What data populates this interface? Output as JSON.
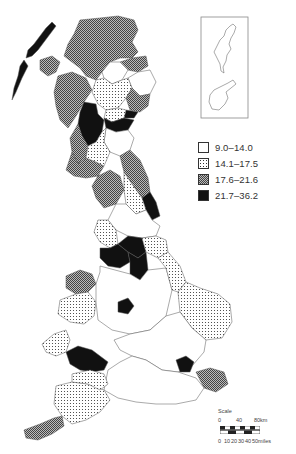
{
  "map": {
    "type": "choropleth",
    "subject": "Great Britain local authority districts",
    "classes": [
      {
        "id": "c1",
        "label": "9.0–14.0",
        "fill": "#ffffff",
        "pattern": "none"
      },
      {
        "id": "c2",
        "label": "14.1–17.5",
        "fill": "#ffffff",
        "pattern": "dots"
      },
      {
        "id": "c3",
        "label": "17.6–21.6",
        "fill": "#8a8a8a",
        "pattern": "crosshatch"
      },
      {
        "id": "c4",
        "label": "21.7–36.2",
        "fill": "#111111",
        "pattern": "solid"
      }
    ],
    "inset": {
      "label": "Shetland Islands",
      "class": "c1"
    }
  },
  "legend": {
    "items": [
      {
        "label": "9.0–14.0"
      },
      {
        "label": "14.1–17.5"
      },
      {
        "label": "17.6–21.6"
      },
      {
        "label": "21.7–36.2"
      }
    ]
  },
  "scale": {
    "title": "Scale",
    "km_ticks": [
      "0",
      "40",
      "80km"
    ],
    "mile_ticks": [
      "0",
      "10",
      "20",
      "30",
      "40",
      "50miles"
    ]
  },
  "regions": [
    {
      "name": "western-isles",
      "class": "c4"
    },
    {
      "name": "highland",
      "class": "c3"
    },
    {
      "name": "skye-lochalsh",
      "class": "c3"
    },
    {
      "name": "argyll",
      "class": "c3"
    },
    {
      "name": "grampian-north",
      "class": "c3"
    },
    {
      "name": "moray",
      "class": "c1"
    },
    {
      "name": "aberdeen",
      "class": "c1"
    },
    {
      "name": "perth-kinross",
      "class": "c2"
    },
    {
      "name": "angus",
      "class": "c3"
    },
    {
      "name": "dundee",
      "class": "c4"
    },
    {
      "name": "fife",
      "class": "c2"
    },
    {
      "name": "clydeside",
      "class": "c4"
    },
    {
      "name": "edinburgh-lothian",
      "class": "c4"
    },
    {
      "name": "borders",
      "class": "c1"
    },
    {
      "name": "ayrshire",
      "class": "c3"
    },
    {
      "name": "dumfries-galloway",
      "class": "c3"
    },
    {
      "name": "lanark",
      "class": "c2"
    },
    {
      "name": "northumberland",
      "class": "c3"
    },
    {
      "name": "tyne-wear",
      "class": "c4"
    },
    {
      "name": "cumbria",
      "class": "c3"
    },
    {
      "name": "durham",
      "class": "c2"
    },
    {
      "name": "north-yorkshire",
      "class": "c1"
    },
    {
      "name": "lancashire",
      "class": "c2"
    },
    {
      "name": "merseyside-manchester",
      "class": "c4"
    },
    {
      "name": "west-yorkshire",
      "class": "c4"
    },
    {
      "name": "south-yorkshire",
      "class": "c4"
    },
    {
      "name": "humberside",
      "class": "c2"
    },
    {
      "name": "north-wales",
      "class": "c3"
    },
    {
      "name": "mid-wales",
      "class": "c2"
    },
    {
      "name": "south-wales-valleys",
      "class": "c4"
    },
    {
      "name": "dyfed",
      "class": "c2"
    },
    {
      "name": "midlands",
      "class": "c1"
    },
    {
      "name": "birmingham",
      "class": "c4"
    },
    {
      "name": "lincolnshire",
      "class": "c2"
    },
    {
      "name": "east-anglia",
      "class": "c2"
    },
    {
      "name": "home-counties",
      "class": "c1"
    },
    {
      "name": "london",
      "class": "c4"
    },
    {
      "name": "kent",
      "class": "c3"
    },
    {
      "name": "south-coast",
      "class": "c1"
    },
    {
      "name": "devon",
      "class": "c2"
    },
    {
      "name": "cornwall",
      "class": "c3"
    },
    {
      "name": "somerset-dorset",
      "class": "c2"
    }
  ]
}
